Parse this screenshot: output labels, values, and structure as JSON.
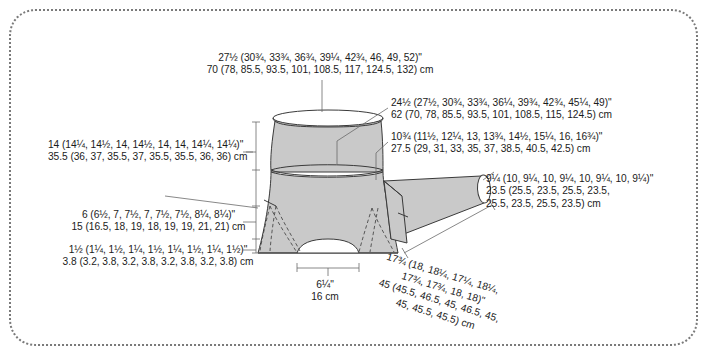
{
  "diagram": {
    "colors": {
      "garment_fill": "#c9c9c9",
      "outline": "#3a3a3a",
      "frame_dots": "#7a7a7a",
      "text": "#1b1b1b",
      "leader_line": "#5a5a5a"
    }
  },
  "labels": {
    "chest": {
      "inches": "27½ (30¾, 33¾, 36¾, 39¼, 42¾, 46, 49, 52)\"",
      "cm": "70 (78, 85.5, 93.5, 101, 108.5, 117, 124.5, 132) cm"
    },
    "body_length": {
      "inches": "24½ (27½, 30¾, 33¾, 36¼, 39¾, 42¾, 45¼, 49)\"",
      "cm": "62 (70, 78, 85.5, 93.5, 101, 108.5, 115, 124.5) cm"
    },
    "yoke_depth": {
      "inches": "10¾ (11½, 12¼, 13, 13¾, 14½, 15¼, 16, 16¾)\"",
      "cm": "27.5 (29, 31, 33, 35, 37, 38.5, 40.5, 42.5) cm"
    },
    "upper_arm": {
      "inches": "9¼ (10, 9¼, 10, 9¼, 10, 9¼, 10, 9¼)\"",
      "cm_line1": "23.5 (25.5, 23.5, 25.5, 23.5,",
      "cm_line2": "25.5, 23.5, 25.5, 23.5) cm"
    },
    "hem_circumference": {
      "inches": "14 (14¼, 14½, 14, 14½, 14, 14, 14¼, 14¼)\"",
      "cm": "35.5 (36, 37, 35.5, 37, 35.5, 35.5, 36, 36) cm"
    },
    "hip_depth": {
      "inches": "6 (6½, 7, 7½, 7, 7½, 7½, 8¼, 8¼)\"",
      "cm": "15 (16.5, 18, 19, 18, 19, 19, 21, 21) cm"
    },
    "edging": {
      "inches": "1½ (1¼, 1½, 1¼, 1½, 1¼, 1½, 1¼, 1½)\"",
      "cm": "3.8 (3.2, 3.8, 3.2, 3.8, 3.2, 3.8, 3.2, 3.8) cm"
    },
    "cuff": {
      "inches": "6¼\"",
      "cm": "16 cm"
    },
    "sleeve_length": {
      "inches_line1": "17¾ (18, 18¼, 17¼, 18¼,",
      "inches_line2": "17¾, 17¾, 18, 18)\"",
      "cm_line1": "45 (45.5, 46.5, 45, 46.5, 45,",
      "cm_line2": "45, 45.5, 45.5) cm"
    }
  }
}
